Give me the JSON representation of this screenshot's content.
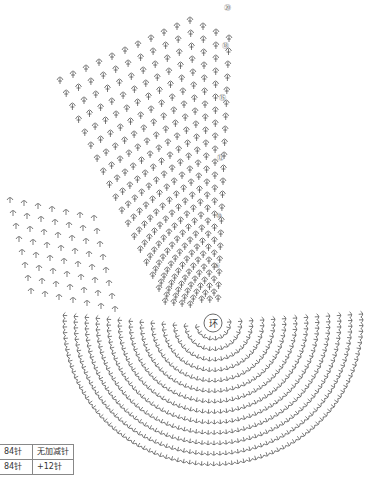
{
  "diagram": {
    "type": "crochet-stitch-chart",
    "center_label": "环",
    "row_markers": [
      "⑳",
      "⑱",
      "⑮",
      "⑫",
      "⑩",
      "⑤"
    ],
    "colors": {
      "ink": "#333333",
      "background": "#ffffff"
    }
  },
  "table": {
    "rows": [
      {
        "stitches": "84针",
        "change": "无加减针"
      },
      {
        "stitches": "84针",
        "change": "+12针"
      }
    ]
  }
}
